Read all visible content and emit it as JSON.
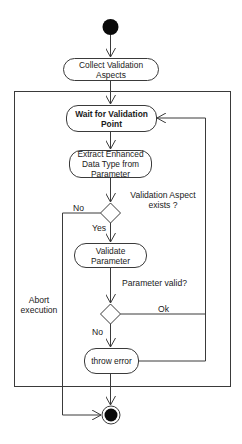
{
  "diagram": {
    "type": "UML activity diagram",
    "colors": {
      "line": "#3a3a3a",
      "node_fill": "#ffffff",
      "terminal": "#0a0a0a",
      "text": "#1a1a1a"
    },
    "nodes": {
      "start": {
        "label": "start-node"
      },
      "collect": {
        "label": "Collect Validation Aspects"
      },
      "wait": {
        "label": "Wait for Validation Point"
      },
      "extract": {
        "label": "Extract Enhanced Data Type from Parameter"
      },
      "validate": {
        "label": "Validate Parameter"
      },
      "throw": {
        "label": "throw error"
      },
      "end": {
        "label": "end-node"
      }
    },
    "decisions": {
      "aspect_exists": {
        "question": "Validation Aspect exists ?",
        "question_line1": "Validation Aspect",
        "question_line2": "exists ?",
        "yes": "Yes",
        "no": "No"
      },
      "param_valid": {
        "question": "Parameter valid?",
        "ok": "Ok",
        "no": "No"
      }
    },
    "labels": {
      "abort_line1": "Abort",
      "abort_line2": "execution"
    }
  }
}
